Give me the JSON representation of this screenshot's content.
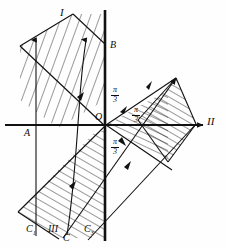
{
  "figure": {
    "type": "geometric-diagram",
    "background": "#fefefe",
    "ink": "#0d0d0d",
    "labels": {
      "region_upper": "I",
      "region_right_axis": "II",
      "region_lower": "III",
      "origin": "O",
      "point_a": "A",
      "point_b": "B",
      "point_c": "C",
      "point_c1": "C",
      "point_c1_sub": "1",
      "point_c3": "C",
      "point_c3_sub": "3"
    },
    "angles": [
      {
        "name": "angle-upper",
        "numerator": "π",
        "denominator": "3",
        "x": 113,
        "y": 88
      },
      {
        "name": "angle-inner",
        "numerator": "π",
        "denominator": "3",
        "x": 135,
        "y": 108
      },
      {
        "name": "angle-lower",
        "numerator": "π",
        "denominator": "3",
        "x": 113,
        "y": 140
      }
    ],
    "geometry": {
      "origin": [
        105,
        125
      ],
      "axis_y": 125,
      "axis_x_start": 5,
      "axis_x_end": 205,
      "vertical_line_x": 105,
      "vertical_line_top": 10,
      "vertical_line_bottom": 241
    }
  }
}
